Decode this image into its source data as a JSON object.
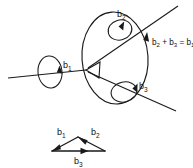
{
  "figure": {
    "background_color": "#ffffff",
    "ink_color": "#1a1a1a",
    "labels": {
      "b1_main": {
        "base": "b",
        "sub": "1"
      },
      "b2_loop": {
        "base": "b",
        "sub": "2"
      },
      "b3_loop": {
        "base": "b",
        "sub": "3"
      },
      "equation": {
        "term1_base": "b",
        "term1_sub": "2",
        "plus": "+",
        "term2_base": "b",
        "term2_sub": "3",
        "equals": "=",
        "term3_base": "b",
        "term3_sub": "1"
      }
    },
    "triangle": {
      "edge_b1": {
        "base": "b",
        "sub": "1"
      },
      "edge_b2": {
        "base": "b",
        "sub": "2"
      },
      "edge_b3": {
        "base": "b",
        "sub": "3"
      }
    },
    "elements": {
      "large_loop_name": "large-dislocation-loop",
      "left_circuit_name": "left-burgers-circuit",
      "upper_circuit_name": "upper-burgers-circuit",
      "lower_circuit_name": "lower-burgers-circuit",
      "node_name": "dislocation-node"
    }
  }
}
